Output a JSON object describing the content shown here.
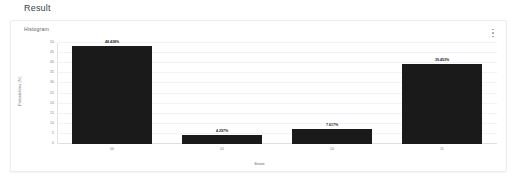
{
  "page": {
    "title": "Result"
  },
  "card": {
    "label": "Histogram",
    "menu_icon": "more-vert-icon"
  },
  "chart_data": {
    "type": "bar",
    "title": "Histogram",
    "categories": [
      "00",
      "01",
      "10",
      "11"
    ],
    "values": [
      48.438,
      4.297,
      7.617,
      39.453
    ],
    "value_labels": [
      "48.438%",
      "4.297%",
      "7.617%",
      "39.453%"
    ],
    "xlabel": "State",
    "ylabel": "Probabilities (%)",
    "ylim": [
      0,
      50
    ],
    "yticks": [
      0,
      5,
      10,
      15,
      20,
      25,
      30,
      35,
      40,
      45,
      50
    ],
    "ytick_labels": [
      "0",
      "5",
      "10",
      "15",
      "20",
      "25",
      "30",
      "35",
      "40",
      "45",
      "50"
    ],
    "grid": true,
    "legend": "none",
    "bar_color": "#1a1a1a"
  }
}
